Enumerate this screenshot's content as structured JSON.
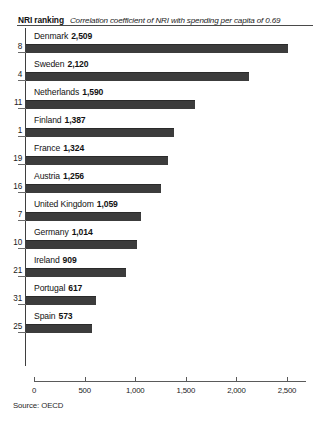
{
  "header": {
    "title": "NRI ranking",
    "note": "Correlation coefficient of NRI with spending per capita of 0.69"
  },
  "source": "Source: OECD",
  "chart_data": {
    "type": "bar",
    "orientation": "horizontal",
    "title": "NRI ranking",
    "subtitle": "Correlation coefficient of NRI with spending per capita of 0.69",
    "xlabel": "",
    "ylabel": "",
    "xlim": [
      0,
      2700
    ],
    "grid": false,
    "legend": null,
    "source": "Source: OECD",
    "xticks": [
      0,
      500,
      1000,
      1500,
      2000,
      2500
    ],
    "xtick_labels": [
      "0",
      "500",
      "1,000",
      "1,500",
      "2,000",
      "2,500"
    ],
    "categories": [
      "Denmark",
      "Sweden",
      "Netherlands",
      "Finland",
      "France",
      "Austria",
      "United Kingdom",
      "Germany",
      "Ireland",
      "Portugal",
      "Spain"
    ],
    "values": [
      2509,
      2120,
      1590,
      1387,
      1324,
      1256,
      1059,
      1014,
      909,
      617,
      573
    ],
    "value_labels": [
      "2,509",
      "2,120",
      "1,590",
      "1,387",
      "1,324",
      "1,256",
      "1,059",
      "1,014",
      "909",
      "617",
      "573"
    ],
    "rankings": [
      8,
      4,
      11,
      1,
      19,
      16,
      7,
      10,
      21,
      31,
      25
    ],
    "bar_color": "#3c3c3c"
  }
}
